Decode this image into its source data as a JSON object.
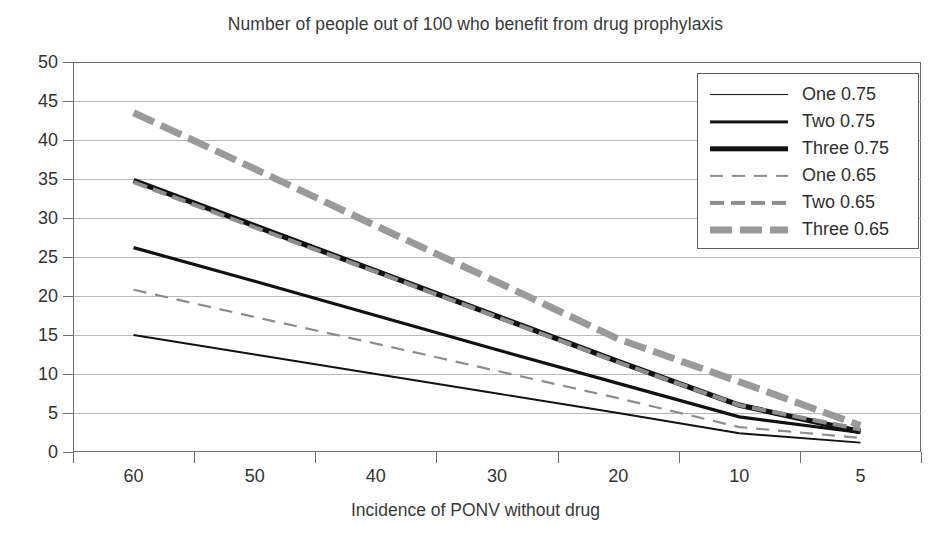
{
  "chart_data": {
    "type": "line",
    "title": "Number of people out of 100 who benefit from drug prophylaxis",
    "xlabel": "Incidence of PONV without drug",
    "ylabel": "",
    "categories": [
      "60",
      "50",
      "40",
      "30",
      "20",
      "10",
      "5"
    ],
    "x": [
      60,
      50,
      40,
      30,
      20,
      10,
      5
    ],
    "ylim": [
      0,
      50
    ],
    "yticks": [
      "0",
      "5",
      "10",
      "15",
      "20",
      "25",
      "30",
      "35",
      "40",
      "45",
      "50"
    ],
    "grid": true,
    "legend_position": "top-right",
    "series": [
      {
        "name": "One 0.75",
        "values": [
          15.0,
          12.5,
          10.0,
          7.5,
          5.0,
          2.4,
          1.2
        ],
        "style": "solid",
        "width": 1.9,
        "color": "#111111"
      },
      {
        "name": "Two 0.75",
        "values": [
          26.2,
          21.9,
          17.5,
          13.1,
          8.8,
          4.5,
          2.5
        ],
        "style": "solid",
        "width": 3.2,
        "color": "#111111"
      },
      {
        "name": "Three 0.75",
        "values": [
          34.8,
          29.0,
          23.2,
          17.4,
          11.6,
          6.0,
          2.6
        ],
        "style": "solid",
        "width": 5.4,
        "color": "#111111"
      },
      {
        "name": "One 0.65",
        "values": [
          20.8,
          17.3,
          13.9,
          10.4,
          6.9,
          3.2,
          1.8
        ],
        "style": "dashed",
        "width": 2.2,
        "color": "#8d8d8d"
      },
      {
        "name": "Two 0.65",
        "values": [
          34.6,
          28.8,
          23.1,
          17.3,
          11.5,
          6.0,
          2.9
        ],
        "style": "dotted-thick",
        "width": 4.2,
        "color": "#8d8d8d"
      },
      {
        "name": "Three 0.65",
        "values": [
          43.5,
          36.3,
          29.0,
          21.8,
          14.5,
          9.0,
          3.4
        ],
        "style": "dashed-thick",
        "width": 7.0,
        "color": "#9a9a9a"
      }
    ]
  },
  "legend": {
    "items": [
      {
        "label": "One 0.75"
      },
      {
        "label": "Two 0.75"
      },
      {
        "label": "Three 0.75"
      },
      {
        "label": "One 0.65"
      },
      {
        "label": "Two 0.65"
      },
      {
        "label": "Three 0.65"
      }
    ]
  },
  "colors": {
    "solid": "#111111",
    "dashed_gray": "#8d8d8d",
    "grid": "#b9b9b9",
    "axis": "#6d6d6d",
    "text": "#2f2f2f",
    "background": "#ffffff"
  }
}
